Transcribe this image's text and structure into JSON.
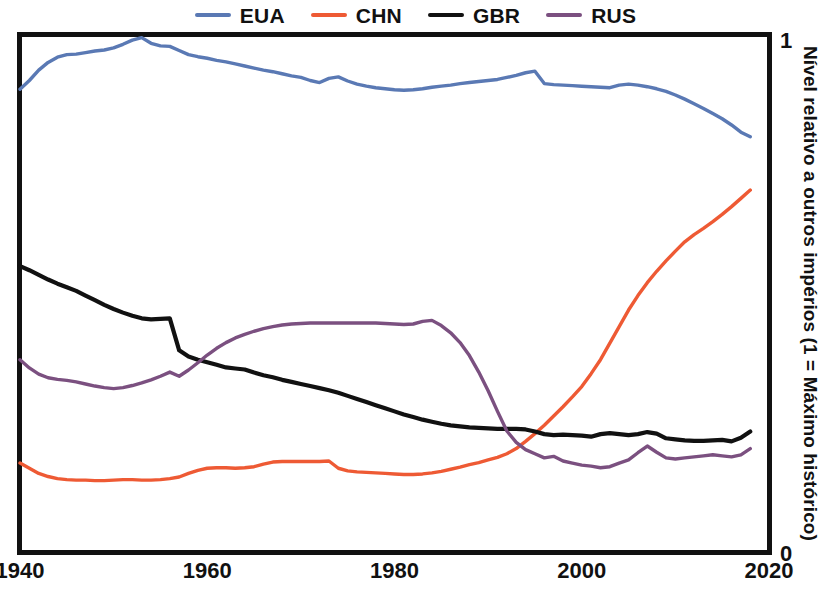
{
  "chart_data": {
    "type": "line",
    "title": "",
    "xlabel": "",
    "ylabel": "Nível relativo a outros impérios (1 = Máximo histórico)",
    "xlim": [
      1940,
      2020
    ],
    "ylim": [
      0,
      1
    ],
    "xticks": [
      1940,
      1960,
      1980,
      2000,
      2020
    ],
    "yticks": [
      0,
      1
    ],
    "ytick_labels": [
      "0",
      "1"
    ],
    "grid": false,
    "legend_position": "top-center",
    "series": [
      {
        "name": "EUA",
        "color": "#5A79B4",
        "x": [
          1940,
          1941,
          1942,
          1943,
          1944,
          1945,
          1946,
          1947,
          1948,
          1949,
          1950,
          1951,
          1952,
          1953,
          1954,
          1955,
          1956,
          1957,
          1958,
          1959,
          1960,
          1961,
          1962,
          1963,
          1964,
          1965,
          1966,
          1967,
          1968,
          1969,
          1970,
          1971,
          1972,
          1973,
          1974,
          1975,
          1976,
          1977,
          1978,
          1979,
          1980,
          1981,
          1982,
          1983,
          1984,
          1985,
          1986,
          1987,
          1988,
          1989,
          1990,
          1991,
          1992,
          1993,
          1994,
          1995,
          1996,
          1997,
          1998,
          1999,
          2000,
          2001,
          2002,
          2003,
          2004,
          2005,
          2006,
          2007,
          2008,
          2009,
          2010,
          2011,
          2012,
          2013,
          2014,
          2015,
          2016,
          2017,
          2018
        ],
        "values": [
          0.895,
          0.912,
          0.932,
          0.947,
          0.957,
          0.962,
          0.963,
          0.966,
          0.969,
          0.971,
          0.975,
          0.982,
          0.99,
          0.995,
          0.984,
          0.979,
          0.978,
          0.97,
          0.962,
          0.958,
          0.955,
          0.951,
          0.948,
          0.944,
          0.94,
          0.936,
          0.932,
          0.929,
          0.925,
          0.921,
          0.918,
          0.912,
          0.908,
          0.916,
          0.919,
          0.911,
          0.905,
          0.901,
          0.898,
          0.896,
          0.894,
          0.893,
          0.894,
          0.896,
          0.899,
          0.901,
          0.903,
          0.906,
          0.908,
          0.91,
          0.912,
          0.914,
          0.918,
          0.922,
          0.927,
          0.93,
          0.906,
          0.904,
          0.903,
          0.902,
          0.901,
          0.9,
          0.899,
          0.898,
          0.903,
          0.905,
          0.903,
          0.9,
          0.896,
          0.891,
          0.884,
          0.876,
          0.867,
          0.858,
          0.848,
          0.838,
          0.826,
          0.812,
          0.803
        ]
      },
      {
        "name": "CHN",
        "color": "#EE5A34",
        "x": [
          1940,
          1941,
          1942,
          1943,
          1944,
          1945,
          1946,
          1947,
          1948,
          1949,
          1950,
          1951,
          1952,
          1953,
          1954,
          1955,
          1956,
          1957,
          1958,
          1959,
          1960,
          1961,
          1962,
          1963,
          1964,
          1965,
          1966,
          1967,
          1968,
          1969,
          1970,
          1971,
          1972,
          1973,
          1974,
          1975,
          1976,
          1977,
          1978,
          1979,
          1980,
          1981,
          1982,
          1983,
          1984,
          1985,
          1986,
          1987,
          1988,
          1989,
          1990,
          1991,
          1992,
          1993,
          1994,
          1995,
          1996,
          1997,
          1998,
          1999,
          2000,
          2001,
          2002,
          2003,
          2004,
          2005,
          2006,
          2007,
          2008,
          2009,
          2010,
          2011,
          2012,
          2013,
          2014,
          2015,
          2016,
          2017,
          2018
        ],
        "values": [
          0.172,
          0.162,
          0.152,
          0.146,
          0.142,
          0.14,
          0.139,
          0.139,
          0.138,
          0.138,
          0.139,
          0.14,
          0.14,
          0.139,
          0.139,
          0.14,
          0.142,
          0.145,
          0.152,
          0.158,
          0.162,
          0.163,
          0.163,
          0.162,
          0.163,
          0.165,
          0.17,
          0.174,
          0.175,
          0.175,
          0.175,
          0.175,
          0.175,
          0.176,
          0.162,
          0.157,
          0.155,
          0.154,
          0.153,
          0.152,
          0.151,
          0.15,
          0.15,
          0.151,
          0.153,
          0.156,
          0.16,
          0.164,
          0.169,
          0.173,
          0.178,
          0.183,
          0.19,
          0.2,
          0.214,
          0.229,
          0.245,
          0.263,
          0.281,
          0.3,
          0.32,
          0.345,
          0.372,
          0.404,
          0.436,
          0.468,
          0.496,
          0.521,
          0.543,
          0.563,
          0.582,
          0.6,
          0.614,
          0.626,
          0.639,
          0.653,
          0.668,
          0.684,
          0.7
        ]
      },
      {
        "name": "GBR",
        "color": "#111111",
        "x": [
          1940,
          1941,
          1942,
          1943,
          1944,
          1945,
          1946,
          1947,
          1948,
          1949,
          1950,
          1951,
          1952,
          1953,
          1954,
          1955,
          1956,
          1957,
          1958,
          1959,
          1960,
          1961,
          1962,
          1963,
          1964,
          1965,
          1966,
          1967,
          1968,
          1969,
          1970,
          1971,
          1972,
          1973,
          1974,
          1975,
          1976,
          1977,
          1978,
          1979,
          1980,
          1981,
          1982,
          1983,
          1984,
          1985,
          1986,
          1987,
          1988,
          1989,
          1990,
          1991,
          1992,
          1993,
          1994,
          1995,
          1996,
          1997,
          1998,
          1999,
          2000,
          2001,
          2002,
          2003,
          2004,
          2005,
          2006,
          2007,
          2008,
          2009,
          2010,
          2011,
          2012,
          2013,
          2014,
          2015,
          2016,
          2017,
          2018
        ],
        "values": [
          0.553,
          0.545,
          0.536,
          0.527,
          0.519,
          0.512,
          0.505,
          0.496,
          0.487,
          0.478,
          0.47,
          0.463,
          0.457,
          0.452,
          0.45,
          0.451,
          0.452,
          0.39,
          0.378,
          0.372,
          0.367,
          0.362,
          0.357,
          0.355,
          0.353,
          0.347,
          0.342,
          0.338,
          0.333,
          0.329,
          0.325,
          0.321,
          0.317,
          0.313,
          0.308,
          0.302,
          0.296,
          0.29,
          0.284,
          0.278,
          0.272,
          0.266,
          0.261,
          0.256,
          0.252,
          0.248,
          0.245,
          0.243,
          0.241,
          0.24,
          0.239,
          0.238,
          0.238,
          0.238,
          0.237,
          0.233,
          0.228,
          0.226,
          0.227,
          0.226,
          0.225,
          0.223,
          0.228,
          0.23,
          0.228,
          0.226,
          0.228,
          0.232,
          0.229,
          0.22,
          0.218,
          0.216,
          0.215,
          0.215,
          0.216,
          0.217,
          0.214,
          0.221,
          0.233
        ]
      },
      {
        "name": "RUS",
        "color": "#7B5080",
        "x": [
          1940,
          1941,
          1942,
          1943,
          1944,
          1945,
          1946,
          1947,
          1948,
          1949,
          1950,
          1951,
          1952,
          1953,
          1954,
          1955,
          1956,
          1957,
          1958,
          1959,
          1960,
          1961,
          1962,
          1963,
          1964,
          1965,
          1966,
          1967,
          1968,
          1969,
          1970,
          1971,
          1972,
          1973,
          1974,
          1975,
          1976,
          1977,
          1978,
          1979,
          1980,
          1981,
          1982,
          1983,
          1984,
          1985,
          1986,
          1987,
          1988,
          1989,
          1990,
          1991,
          1992,
          1993,
          1994,
          1995,
          1996,
          1997,
          1998,
          1999,
          2000,
          2001,
          2002,
          2003,
          2004,
          2005,
          2006,
          2007,
          2008,
          2009,
          2010,
          2011,
          2012,
          2013,
          2014,
          2015,
          2016,
          2017,
          2018
        ],
        "values": [
          0.372,
          0.356,
          0.344,
          0.337,
          0.334,
          0.332,
          0.329,
          0.325,
          0.321,
          0.318,
          0.316,
          0.318,
          0.322,
          0.327,
          0.333,
          0.34,
          0.348,
          0.34,
          0.352,
          0.366,
          0.381,
          0.394,
          0.405,
          0.414,
          0.421,
          0.427,
          0.432,
          0.436,
          0.439,
          0.441,
          0.442,
          0.443,
          0.443,
          0.443,
          0.443,
          0.443,
          0.443,
          0.443,
          0.443,
          0.442,
          0.441,
          0.44,
          0.441,
          0.446,
          0.448,
          0.438,
          0.424,
          0.405,
          0.38,
          0.348,
          0.312,
          0.272,
          0.234,
          0.212,
          0.198,
          0.19,
          0.182,
          0.185,
          0.176,
          0.172,
          0.168,
          0.166,
          0.163,
          0.165,
          0.172,
          0.178,
          0.192,
          0.205,
          0.193,
          0.182,
          0.18,
          0.182,
          0.184,
          0.186,
          0.188,
          0.186,
          0.184,
          0.188,
          0.2
        ]
      }
    ]
  },
  "legend": {
    "items": [
      {
        "label": "EUA",
        "color": "#5A79B4"
      },
      {
        "label": "CHN",
        "color": "#EE5A34"
      },
      {
        "label": "GBR",
        "color": "#111111"
      },
      {
        "label": "RUS",
        "color": "#7B5080"
      }
    ]
  },
  "axes": {
    "x_tick_labels": [
      "1940",
      "1960",
      "1980",
      "2000",
      "2020"
    ],
    "y_top_label": "1",
    "y_bottom_label": "0",
    "y_axis_title": "Nível relativo a outros impérios (1 = Máximo histórico)"
  }
}
